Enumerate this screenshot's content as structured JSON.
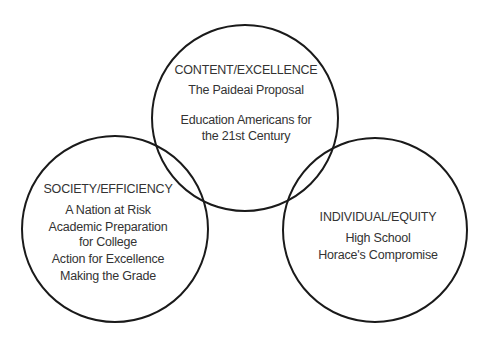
{
  "diagram": {
    "type": "venn",
    "stroke_color": "#1a1a1a",
    "text_color": "#333333",
    "circles": [
      {
        "id": "content",
        "heading": "CONTENT/EXCELLENCE",
        "items": [
          "The Paideai Proposal",
          "Education Americans for",
          "the 21st Century"
        ]
      },
      {
        "id": "society",
        "heading": "SOCIETY/EFFICIENCY",
        "items": [
          "A Nation at Risk",
          "Academic Preparation",
          "for College",
          "Action for Excellence",
          "Making the Grade"
        ]
      },
      {
        "id": "individual",
        "heading": "INDIVIDUAL/EQUITY",
        "items": [
          "High School",
          "Horace's Compromise"
        ]
      }
    ]
  }
}
